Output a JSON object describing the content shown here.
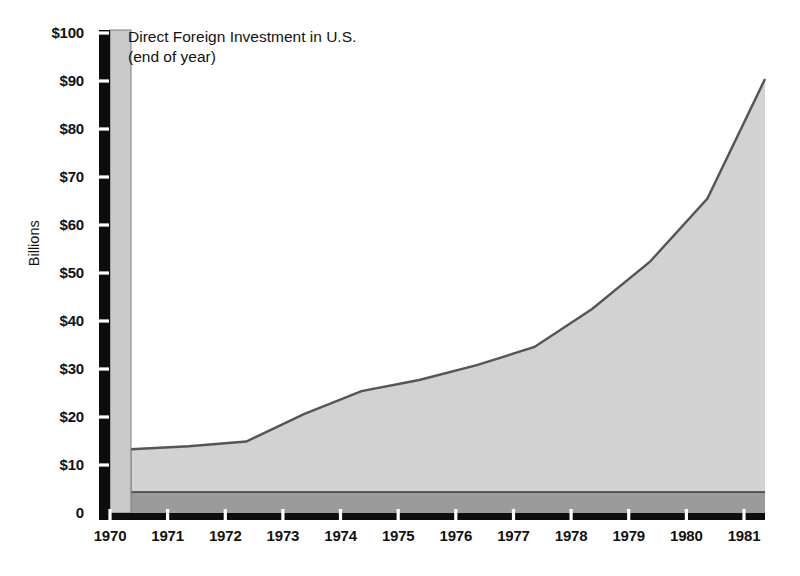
{
  "chart": {
    "title_line1": "Direct Foreign Investment in U.S.",
    "title_line2": "(end of year)",
    "y_axis_title": "Billions",
    "colors": {
      "area_fill": "#d2d2d2",
      "floor_fill": "#9b9b9b",
      "line_stroke": "#555555",
      "axis_bar": "#0d0d0d",
      "axis_side_panel": "#c9c9c9",
      "tick_notch": "#ffffff",
      "text": "#121212",
      "background": "#ffffff"
    }
  },
  "chart_data": {
    "type": "area",
    "title": "Direct Foreign Investment in U.S. (end of year)",
    "subtitle": "(end of year)",
    "xlabel": "",
    "ylabel": "Billions",
    "ylim": [
      0,
      100
    ],
    "grid": false,
    "legend": null,
    "style": "3d-perspective-area",
    "ytick_labels": [
      "$100",
      "$90",
      "$80",
      "$70",
      "$60",
      "$50",
      "$40",
      "$30",
      "$20",
      "$10",
      "0"
    ],
    "ytick_values": [
      100,
      90,
      80,
      70,
      60,
      50,
      40,
      30,
      20,
      10,
      0
    ],
    "categories": [
      "1970",
      "1971",
      "1972",
      "1973",
      "1974",
      "1975",
      "1976",
      "1977",
      "1978",
      "1979",
      "1980",
      "1981"
    ],
    "x": [
      1970,
      1971,
      1972,
      1973,
      1974,
      1975,
      1976,
      1977,
      1978,
      1979,
      1980,
      1981
    ],
    "values": [
      13.3,
      13.9,
      14.9,
      20.6,
      25.4,
      27.7,
      30.8,
      34.6,
      42.5,
      52.3,
      65.5,
      90.4
    ],
    "series": [
      {
        "name": "Direct Foreign Investment in U.S.",
        "values": [
          13.3,
          13.9,
          14.9,
          20.6,
          25.4,
          27.7,
          30.8,
          34.6,
          42.5,
          52.3,
          65.5,
          90.4
        ]
      }
    ]
  }
}
